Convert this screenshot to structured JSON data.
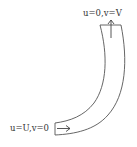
{
  "diagram": {
    "type": "curved-pipe-bend",
    "inlet": {
      "label": "u=U,v=0",
      "arrow_direction": "right"
    },
    "outlet": {
      "label": "u=0,v=V",
      "arrow_direction": "up"
    },
    "colors": {
      "stroke": "#555555",
      "text": "#333333",
      "background": "#ffffff"
    }
  }
}
